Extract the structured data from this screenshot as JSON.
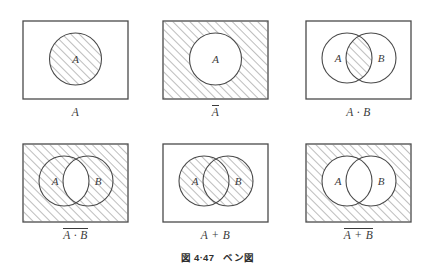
{
  "figure": {
    "caption_number": "図 4·47",
    "caption_title": "ベン図",
    "caption_full": "図 4·47　ベン図"
  },
  "style": {
    "stroke_color": "#4a4a4a",
    "hatch_color": "#6d6d6d",
    "text_color": "#3b3b3b",
    "background": "#ffffff"
  },
  "panels": [
    {
      "id": "panel-a",
      "caption": "A",
      "overline": false,
      "circles": [
        "A"
      ],
      "shaded_region": "A",
      "description": "Single circle A shaded inside rectangle"
    },
    {
      "id": "panel-a-bar",
      "caption": "A",
      "overline": true,
      "circles": [
        "A"
      ],
      "shaded_region": "not A",
      "description": "Rectangle shaded outside circle A"
    },
    {
      "id": "panel-a-and-b",
      "caption": "A · B",
      "overline": false,
      "circles": [
        "A",
        "B"
      ],
      "shaded_region": "A and B",
      "description": "Intersection lens of A and B shaded"
    },
    {
      "id": "panel-not-a-and-b",
      "caption": "A · B",
      "overline": true,
      "circles": [
        "A",
        "B"
      ],
      "shaded_region": "not (A and B)",
      "description": "Everything shaded except intersection lens"
    },
    {
      "id": "panel-a-or-b",
      "caption": "A + B",
      "overline": false,
      "circles": [
        "A",
        "B"
      ],
      "shaded_region": "A or B",
      "description": "Union of circles A and B shaded"
    },
    {
      "id": "panel-not-a-or-b",
      "caption": "A + B",
      "overline": true,
      "circles": [
        "A",
        "B"
      ],
      "shaded_region": "not (A or B)",
      "description": "Rectangle shaded outside union of A and B"
    }
  ],
  "circle_labels": {
    "a": "A",
    "b": "B"
  }
}
